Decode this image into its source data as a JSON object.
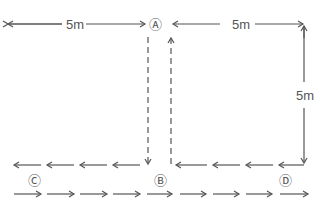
{
  "diagram": {
    "points": {
      "A": {
        "label": "Ⓐ"
      },
      "B": {
        "label": "Ⓑ"
      },
      "C": {
        "label": "Ⓒ"
      },
      "D": {
        "label": "Ⓓ"
      }
    },
    "dimensions": {
      "left_top": "5m",
      "right_top": "5m",
      "right_vertical": "5m"
    },
    "colors": {
      "line": "#555555",
      "background": "#ffffff"
    }
  }
}
